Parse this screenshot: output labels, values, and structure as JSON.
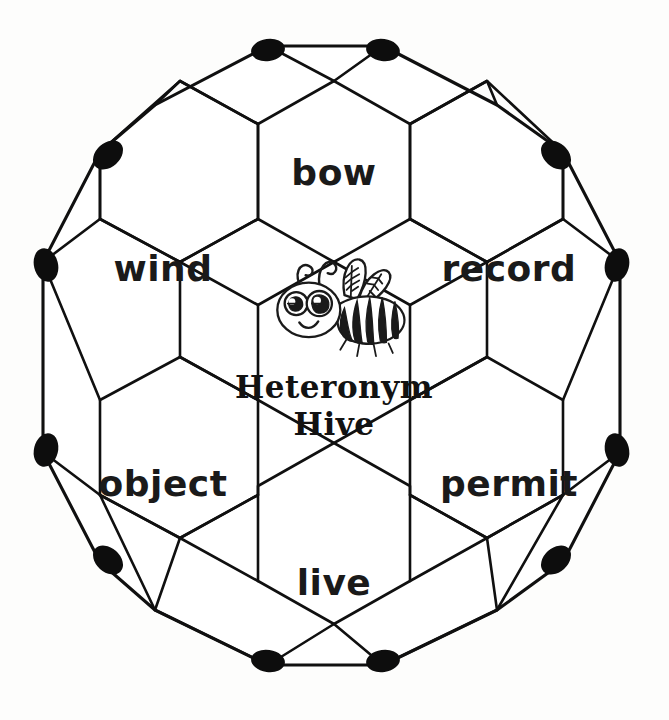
{
  "figure": {
    "title": "Heteronym Hive",
    "brand_line_1": "Heteronym",
    "brand_line_2": "Hive",
    "center_icon": "bee-illustration",
    "shape": "truncated-icosahedron-hexagon-net",
    "stroke_color": "#101010",
    "face_color": "#ffffff",
    "background_color": "#fdfdfc",
    "vertex_color": "#0d0d0d"
  },
  "cells": [
    {
      "id": "bow",
      "label": "bow",
      "position": "top",
      "cx": 334,
      "cy": 172
    },
    {
      "id": "wind",
      "label": "wind",
      "position": "upper-left",
      "cx": 161,
      "cy": 268
    },
    {
      "id": "record",
      "label": "record",
      "position": "upper-right",
      "cx": 508,
      "cy": 268
    },
    {
      "id": "center",
      "label": "",
      "position": "center",
      "cx": 334,
      "cy": 360
    },
    {
      "id": "object",
      "label": "object",
      "position": "lower-left",
      "cx": 161,
      "cy": 485
    },
    {
      "id": "permit",
      "label": "permit",
      "position": "lower-right",
      "cx": 508,
      "cy": 485
    },
    {
      "id": "live",
      "label": "live",
      "position": "bottom",
      "cx": 334,
      "cy": 581
    }
  ],
  "counts": {
    "word_cells": 6,
    "center_cells": 1,
    "vertex_nodes": 12
  }
}
